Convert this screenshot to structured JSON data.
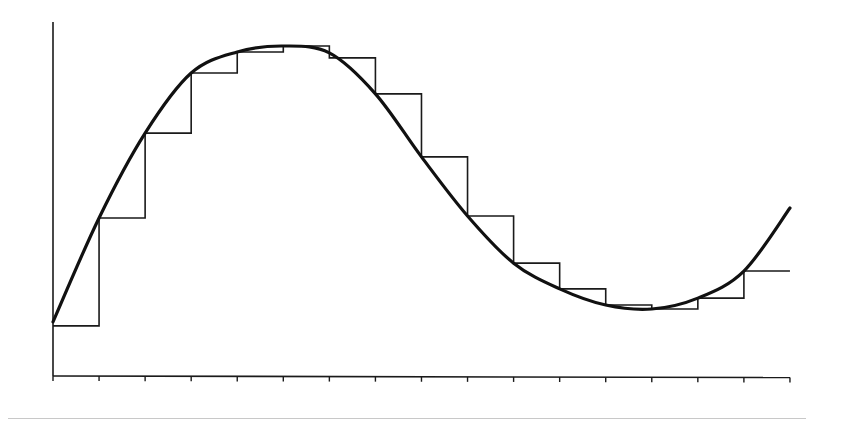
{
  "colors": {
    "line": "#111111",
    "axis": "#1a1a1a",
    "background": "#ffffff",
    "page_rule": "#c8c8c8"
  },
  "chart_data": {
    "type": "line",
    "title": "",
    "xlabel": "",
    "ylabel": "",
    "grid": false,
    "legend": "none",
    "x_ticks": [
      0,
      1,
      2,
      3,
      4,
      5,
      6,
      7,
      8,
      9,
      10,
      11,
      12,
      13,
      14,
      15,
      16
    ],
    "tick_labels_visible": false,
    "xlim": [
      0,
      16
    ],
    "ylim": [
      0,
      107
    ],
    "series": [
      {
        "name": "continuous-curve",
        "style": "thick smooth line",
        "x": [
          0,
          1,
          2,
          3,
          4,
          5,
          6,
          7,
          8,
          9,
          10,
          11,
          12,
          13,
          14,
          15,
          16
        ],
        "values": [
          16.4,
          47.9,
          73.6,
          91.8,
          98.2,
          100,
          97.9,
          85.5,
          66.4,
          48.5,
          34.2,
          26.4,
          21.5,
          20.3,
          23.6,
          31.8,
          50.9
        ]
      },
      {
        "name": "step-approximation",
        "style": "thin staircase (value held over each interval)",
        "intervals": [
          [
            0,
            1
          ],
          [
            1,
            2
          ],
          [
            2,
            3
          ],
          [
            3,
            4
          ],
          [
            4,
            5
          ],
          [
            5,
            6
          ],
          [
            6,
            7
          ],
          [
            7,
            8
          ],
          [
            8,
            9
          ],
          [
            9,
            10
          ],
          [
            10,
            11
          ],
          [
            11,
            12
          ],
          [
            12,
            13
          ],
          [
            13,
            14
          ],
          [
            14,
            15
          ],
          [
            15,
            16
          ]
        ],
        "values": [
          15.2,
          47.9,
          73.6,
          91.8,
          98.2,
          100,
          96.4,
          85.5,
          66.4,
          48.5,
          34.2,
          26.4,
          21.5,
          20.3,
          23.6,
          31.8
        ]
      }
    ]
  },
  "layout": {
    "origin_px": [
      53,
      376
    ],
    "x_end_px": 790,
    "y_top_px": 22,
    "px_per_x": 46.06,
    "px_per_y": 3.3
  }
}
